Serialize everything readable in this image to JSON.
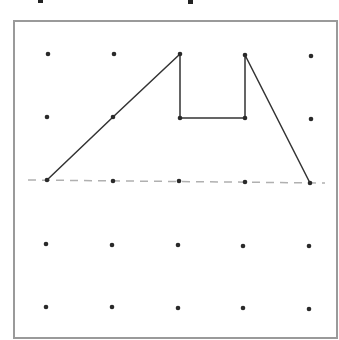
{
  "diagram": {
    "type": "dot-grid-geoboard",
    "grid": {
      "rows": 5,
      "cols": 5,
      "dot_color": "#2a2a2a",
      "points": [
        [
          [
            48,
            54
          ],
          [
            114,
            54
          ],
          [
            180,
            54
          ],
          [
            245,
            55
          ],
          [
            311,
            56
          ]
        ],
        [
          [
            47,
            117
          ],
          [
            113,
            117
          ],
          [
            180,
            118
          ],
          [
            245,
            118
          ],
          [
            311,
            119
          ]
        ],
        [
          [
            47,
            180
          ],
          [
            113,
            181
          ],
          [
            179,
            181
          ],
          [
            245,
            182
          ],
          [
            310,
            183
          ]
        ],
        [
          [
            46,
            244
          ],
          [
            112,
            245
          ],
          [
            178,
            245
          ],
          [
            243,
            246
          ],
          [
            309,
            246
          ]
        ],
        [
          [
            46,
            307
          ],
          [
            112,
            307
          ],
          [
            178,
            308
          ],
          [
            243,
            308
          ],
          [
            309,
            309
          ]
        ]
      ]
    },
    "frame": {
      "left": 14,
      "top": 21,
      "right": 337,
      "bottom": 338,
      "color": "#9a9a9a"
    },
    "shape": {
      "color": "#333333",
      "description": "Open polyline shape on grid",
      "vertices": [
        [
          47,
          180
        ],
        [
          113,
          117
        ],
        [
          180,
          54
        ],
        [
          180,
          118
        ],
        [
          245,
          118
        ],
        [
          245,
          55
        ],
        [
          310,
          183
        ]
      ],
      "vertex_grid_coords": [
        [
          2,
          0
        ],
        [
          1,
          1
        ],
        [
          0,
          2
        ],
        [
          1,
          2
        ],
        [
          1,
          3
        ],
        [
          0,
          3
        ],
        [
          2,
          4
        ]
      ]
    },
    "line_of_symmetry": {
      "style": "dashed",
      "color": "#b0b0b0",
      "from": [
        28,
        180
      ],
      "to": [
        325,
        183
      ]
    }
  }
}
